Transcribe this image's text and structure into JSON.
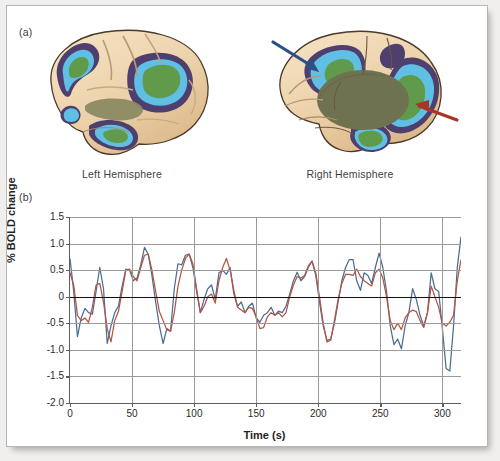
{
  "figure": {
    "panel_a_label": "(a)",
    "panel_b_label": "(b)"
  },
  "brains": {
    "left_label": "Left Hemisphere",
    "right_label": "Right Hemisphere",
    "colors": {
      "cortex_light": "#f0d9b6",
      "cortex_mid": "#e0c096",
      "cortex_shadow": "#c9a477",
      "purple": "#4e3f6e",
      "light_blue": "#5fbfe4",
      "green": "#5f9b4a",
      "olive": "#6f7251",
      "outline": "#4a3a28",
      "arrow_blue": "#2c4f86",
      "arrow_red": "#a93527"
    },
    "annotations": [
      {
        "name": "blue-arrow",
        "color": "#2c4f86"
      },
      {
        "name": "red-arrow",
        "color": "#a93527"
      }
    ]
  },
  "chart_data": {
    "type": "line",
    "title": "",
    "xlabel": "Time (s)",
    "ylabel": "% BOLD change",
    "xlim": [
      0,
      315
    ],
    "ylim": [
      -2.0,
      1.5
    ],
    "xticks": [
      0,
      50,
      100,
      150,
      200,
      250,
      300
    ],
    "yticks": [
      1.5,
      1.0,
      0.5,
      0,
      -0.5,
      -1.0,
      -1.5,
      -2.0
    ],
    "ytick_labels": [
      "1.5",
      "1.0",
      "0.5",
      "0",
      "-0.5",
      "-1.0",
      "-1.5",
      "-2.0"
    ],
    "xtick_labels": [
      "0",
      "50",
      "100",
      "150",
      "200",
      "250",
      "300"
    ],
    "grid": true,
    "legend": "none",
    "zero_reference_line": 0,
    "series": [
      {
        "name": "blue-trace",
        "color": "#4a6c96",
        "x": [
          0,
          3,
          6,
          9,
          12,
          15,
          18,
          21,
          24,
          27,
          30,
          33,
          36,
          39,
          42,
          45,
          48,
          51,
          54,
          57,
          60,
          63,
          66,
          69,
          72,
          75,
          78,
          81,
          84,
          87,
          90,
          93,
          96,
          99,
          102,
          105,
          108,
          111,
          114,
          117,
          120,
          123,
          126,
          129,
          132,
          135,
          138,
          141,
          144,
          147,
          150,
          153,
          156,
          159,
          162,
          165,
          168,
          171,
          174,
          177,
          180,
          183,
          186,
          189,
          192,
          195,
          198,
          201,
          204,
          207,
          210,
          213,
          216,
          219,
          222,
          225,
          228,
          231,
          234,
          237,
          240,
          243,
          246,
          249,
          252,
          255,
          258,
          261,
          264,
          267,
          270,
          273,
          276,
          279,
          282,
          285,
          288,
          291,
          294,
          297,
          300,
          303,
          306,
          309,
          312,
          315
        ],
        "y": [
          0.72,
          0.1,
          -0.75,
          -0.4,
          -0.22,
          -0.3,
          -0.33,
          0.1,
          0.55,
          0.15,
          -0.88,
          -0.55,
          -0.3,
          -0.18,
          0.2,
          0.52,
          0.5,
          0.3,
          0.35,
          0.6,
          0.93,
          0.8,
          0.4,
          -0.1,
          -0.55,
          -0.88,
          -0.6,
          -0.65,
          0.15,
          0.62,
          0.6,
          0.78,
          0.8,
          0.55,
          0.1,
          -0.3,
          -0.05,
          0.15,
          0.22,
          -0.05,
          0.45,
          0.5,
          0.42,
          0.55,
          0.05,
          -0.18,
          -0.1,
          -0.3,
          -0.18,
          -0.12,
          -0.4,
          -0.48,
          -0.35,
          -0.3,
          -0.2,
          -0.35,
          -0.27,
          -0.3,
          -0.18,
          0.05,
          0.3,
          0.46,
          0.3,
          0.38,
          0.55,
          0.67,
          0.4,
          -0.1,
          -0.55,
          -0.82,
          -0.8,
          -0.5,
          -0.1,
          0.3,
          0.55,
          0.7,
          0.7,
          0.3,
          0.12,
          0.45,
          0.4,
          0.25,
          0.55,
          0.82,
          0.55,
          0.1,
          -0.55,
          -0.9,
          -0.8,
          -0.98,
          -0.55,
          -0.3,
          0.15,
          -0.05,
          -0.35,
          -0.55,
          -0.3,
          0.45,
          0.15,
          0.1,
          -0.6,
          -1.35,
          -1.4,
          -0.55,
          0.55,
          1.13
        ]
      },
      {
        "name": "red-trace",
        "color": "#b5553f",
        "x": [
          0,
          3,
          6,
          9,
          12,
          15,
          18,
          21,
          24,
          27,
          30,
          33,
          36,
          39,
          42,
          45,
          48,
          51,
          54,
          57,
          60,
          63,
          66,
          69,
          72,
          75,
          78,
          81,
          84,
          87,
          90,
          93,
          96,
          99,
          102,
          105,
          108,
          111,
          114,
          117,
          120,
          123,
          126,
          129,
          132,
          135,
          138,
          141,
          144,
          147,
          150,
          153,
          156,
          159,
          162,
          165,
          168,
          171,
          174,
          177,
          180,
          183,
          186,
          189,
          192,
          195,
          198,
          201,
          204,
          207,
          210,
          213,
          216,
          219,
          222,
          225,
          228,
          231,
          234,
          237,
          240,
          243,
          246,
          249,
          252,
          255,
          258,
          261,
          264,
          267,
          270,
          273,
          276,
          279,
          282,
          285,
          288,
          291,
          294,
          297,
          300,
          303,
          306,
          309,
          312,
          315
        ],
        "y": [
          0.45,
          0.22,
          -0.35,
          -0.45,
          -0.4,
          -0.48,
          -0.2,
          0.22,
          0.25,
          -0.1,
          -0.6,
          -0.85,
          -0.45,
          -0.28,
          0.1,
          0.5,
          0.52,
          0.38,
          0.3,
          0.55,
          0.78,
          0.8,
          0.5,
          0.1,
          -0.28,
          -0.45,
          -0.62,
          -0.65,
          -0.3,
          0.2,
          0.5,
          0.72,
          0.8,
          0.62,
          0.15,
          -0.3,
          -0.18,
          0.0,
          0.05,
          -0.12,
          0.3,
          0.55,
          0.72,
          0.5,
          0.12,
          -0.2,
          -0.25,
          -0.3,
          -0.2,
          -0.22,
          -0.38,
          -0.6,
          -0.58,
          -0.38,
          -0.3,
          -0.35,
          -0.3,
          -0.38,
          -0.3,
          0.0,
          0.22,
          0.38,
          0.35,
          0.4,
          0.58,
          0.67,
          0.45,
          0.0,
          -0.5,
          -0.85,
          -0.82,
          -0.45,
          -0.05,
          0.25,
          0.42,
          0.42,
          0.4,
          0.52,
          0.38,
          0.3,
          0.25,
          0.2,
          0.45,
          0.52,
          0.35,
          0.0,
          -0.45,
          -0.62,
          -0.5,
          -0.62,
          -0.4,
          -0.3,
          -0.25,
          -0.28,
          -0.45,
          -0.58,
          -0.3,
          0.2,
          0.0,
          -0.2,
          -0.5,
          -0.55,
          -0.48,
          -0.35,
          0.3,
          0.7
        ]
      }
    ]
  }
}
